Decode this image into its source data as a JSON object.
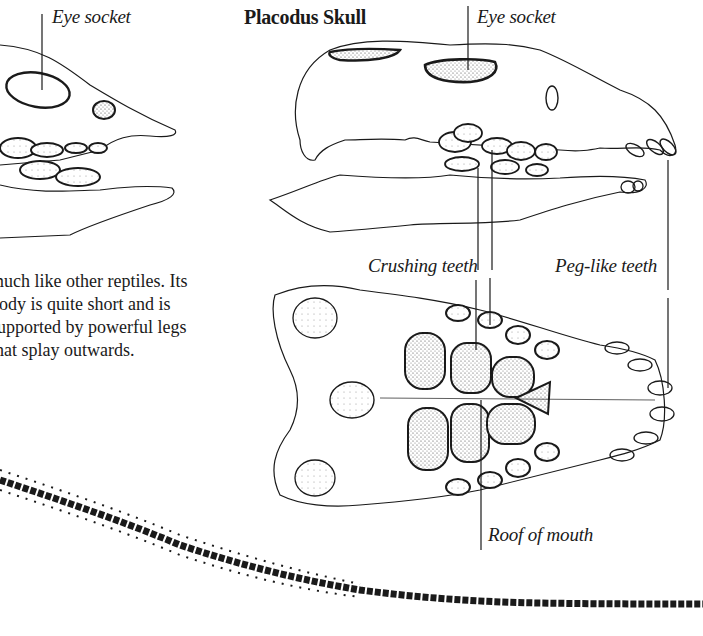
{
  "page": {
    "title": "Placodus Skull",
    "left_skull": {
      "label": "Eye socket"
    },
    "right_skull_side": {
      "label": "Eye socket"
    },
    "underside_labels": {
      "crushing_teeth": "Crushing teeth",
      "peg_like_teeth": "Peg-like teeth",
      "roof_of_mouth": "Roof of mouth"
    },
    "body_text": [
      "much like other reptiles. Its",
      "body is quite short and is",
      "supported by powerful legs",
      "that splay outwards."
    ]
  },
  "illustrations": {
    "left_skull_icon": "partial-skull-side-view",
    "placodus_side_icon": "placodus-skull-side-view",
    "placodus_underside_icon": "placodus-skull-underside-view",
    "tail_icon": "vertebral-tail"
  },
  "colors": {
    "ink": "#1a1a1a",
    "paper": "#ffffff",
    "stipple": "#555555"
  }
}
